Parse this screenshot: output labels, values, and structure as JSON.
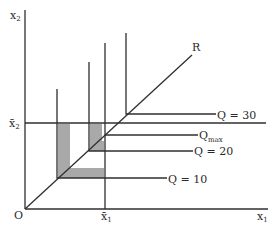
{
  "diagram": {
    "type": "leontief-isoquant-map",
    "colors": {
      "line": "#2f2f2f",
      "shade": "#a9a9a9",
      "background": "#ffffff"
    },
    "axes": {
      "y_label": "x",
      "y_label_sub": "2",
      "x_label": "x",
      "x_label_sub": "1",
      "origin_label": "O"
    },
    "ray": {
      "label": "R"
    },
    "fixed_levels": {
      "x1_bar_label": "x̄",
      "x1_bar_sub": "1",
      "x2_bar_label": "x̄",
      "x2_bar_sub": "2"
    },
    "isoquants": [
      {
        "label": "Q = 10"
      },
      {
        "label": "Q = 20"
      },
      {
        "label": "Q = 30"
      }
    ],
    "qmax": {
      "label": "Q",
      "sub": "max"
    }
  }
}
